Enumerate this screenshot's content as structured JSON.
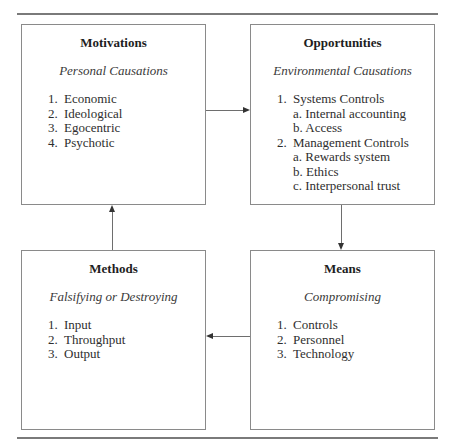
{
  "boxes": {
    "motivations": {
      "title": "Motivations",
      "subtitle": "Personal Causations",
      "items": [
        {
          "num": "1.",
          "label": "Economic"
        },
        {
          "num": "2.",
          "label": "Ideological"
        },
        {
          "num": "3.",
          "label": "Egocentric"
        },
        {
          "num": "4.",
          "label": "Psychotic"
        }
      ]
    },
    "opportunities": {
      "title": "Opportunities",
      "subtitle": "Environmental Causations",
      "items": [
        {
          "num": "1.",
          "label": "Systems Controls"
        },
        {
          "sub": "a. Internal accounting"
        },
        {
          "sub": "b. Access"
        },
        {
          "num": "2.",
          "label": "Management Controls"
        },
        {
          "sub": "a. Rewards system"
        },
        {
          "sub": "b. Ethics"
        },
        {
          "sub": "c. Interpersonal trust"
        }
      ]
    },
    "methods": {
      "title": "Methods",
      "subtitle": "Falsifying or Destroying",
      "items": [
        {
          "num": "1.",
          "label": "Input"
        },
        {
          "num": "2.",
          "label": "Throughput"
        },
        {
          "num": "3.",
          "label": "Output"
        }
      ]
    },
    "means": {
      "title": "Means",
      "subtitle": "Compromising",
      "items": [
        {
          "num": "1.",
          "label": "Controls"
        },
        {
          "num": "2.",
          "label": "Personnel"
        },
        {
          "num": "3.",
          "label": "Technology"
        }
      ]
    }
  },
  "flow": [
    {
      "from": "motivations",
      "to": "opportunities",
      "direction": "right"
    },
    {
      "from": "opportunities",
      "to": "means",
      "direction": "down"
    },
    {
      "from": "means",
      "to": "methods",
      "direction": "left"
    },
    {
      "from": "methods",
      "to": "motivations",
      "direction": "up"
    }
  ],
  "colors": {
    "border": "#8a8a8a",
    "rule": "#7a7a7a",
    "text": "#2a2a2a",
    "arrow": "#333333"
  }
}
